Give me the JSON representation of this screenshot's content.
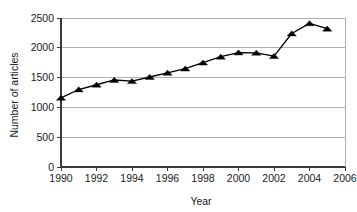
{
  "chart_data": {
    "type": "line",
    "title": "",
    "xlabel": "Year",
    "ylabel": "Number of articles",
    "x": [
      1990,
      1991,
      1992,
      1993,
      1994,
      1995,
      1996,
      1997,
      1998,
      1999,
      2000,
      2001,
      2002,
      2003,
      2004,
      2005
    ],
    "values": [
      1160,
      1300,
      1380,
      1460,
      1440,
      1510,
      1580,
      1650,
      1750,
      1850,
      1920,
      1915,
      1860,
      2240,
      2410,
      2320
    ],
    "series": [
      {
        "name": "Number of articles",
        "values": [
          1160,
          1300,
          1380,
          1460,
          1440,
          1510,
          1580,
          1650,
          1750,
          1850,
          1920,
          1915,
          1860,
          2240,
          2410,
          2320
        ],
        "marker": "triangle",
        "color": "#000000"
      }
    ],
    "xlim": [
      1990,
      2006
    ],
    "ylim": [
      0,
      2500
    ],
    "xticks": [
      1990,
      1992,
      1994,
      1996,
      1998,
      2000,
      2002,
      2004,
      2006
    ],
    "xtick_labels": [
      "1990",
      "1992",
      "1994",
      "1996",
      "1998",
      "2000",
      "2002",
      "2004",
      "2006"
    ],
    "yticks": [
      0,
      500,
      1000,
      1500,
      2000,
      2500
    ],
    "ytick_labels": [
      "0",
      "500",
      "1000",
      "1500",
      "2000",
      "2500"
    ],
    "grid": "horizontal",
    "legend": "none",
    "colors": {
      "line": "#000000",
      "marker": "#000000",
      "gridline": "#a8a8a8",
      "axis": "#3a3a3a",
      "text": "#1a1a1a",
      "background": "#ffffff"
    }
  }
}
